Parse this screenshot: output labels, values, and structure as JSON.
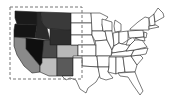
{
  "map": {
    "title": "United States map",
    "selection_box": {
      "x": 10,
      "y": 7,
      "width": 72,
      "height": 72,
      "style": "dashed"
    },
    "shaded_states": [
      {
        "name": "Washington",
        "fill": "#1a1a1a"
      },
      {
        "name": "Oregon",
        "fill": "#141414"
      },
      {
        "name": "Idaho",
        "fill": "#2a2a2a"
      },
      {
        "name": "Montana",
        "fill": "#3a3a3a"
      },
      {
        "name": "Wyoming",
        "fill": "#2e2e2e"
      },
      {
        "name": "Nevada",
        "fill": "#0f0f0f"
      },
      {
        "name": "Utah",
        "fill": "#4a4a4a"
      },
      {
        "name": "Colorado",
        "fill": "#b8b8b8"
      },
      {
        "name": "California",
        "fill": "#8a8a8a"
      },
      {
        "name": "Arizona",
        "fill": "#bdbdbd"
      },
      {
        "name": "New Mexico",
        "fill": "#5a5a5a"
      }
    ],
    "unshaded_fill": "#ffffff"
  }
}
